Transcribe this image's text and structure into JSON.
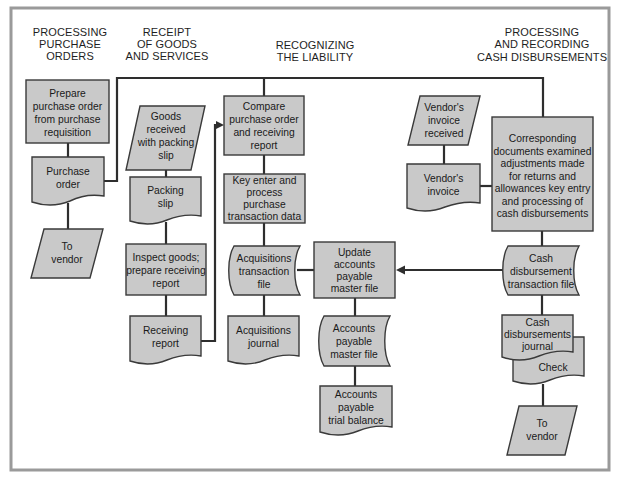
{
  "diagram": {
    "type": "flowchart",
    "colors": {
      "shape_fill": "#c9c9c9",
      "shape_stroke": "#3a3a3a",
      "connector": "#2e2e2e",
      "frame": "#9a9a9a",
      "background": "#ffffff"
    },
    "columns": [
      {
        "id": "col1",
        "lines": [
          "PROCESSING",
          "PURCHASE",
          "ORDERS"
        ]
      },
      {
        "id": "col2",
        "lines": [
          "RECEIPT",
          "OF GOODS",
          "AND SERVICES"
        ]
      },
      {
        "id": "col3",
        "lines": [
          "RECOGNIZING",
          "THE LIABILITY"
        ]
      },
      {
        "id": "col4",
        "lines": [
          "PROCESSING",
          "AND RECORDING",
          "CASH DISBURSEMENTS"
        ]
      }
    ],
    "nodes": [
      {
        "id": "prepare_po",
        "shape": "process",
        "lines": [
          "Prepare",
          "purchase order",
          "from purchase",
          "requisition"
        ]
      },
      {
        "id": "purchase_order",
        "shape": "document",
        "lines": [
          "Purchase",
          "order"
        ]
      },
      {
        "id": "to_vendor_1",
        "shape": "io",
        "lines": [
          "To",
          "vendor"
        ]
      },
      {
        "id": "goods_received",
        "shape": "io",
        "lines": [
          "Goods",
          "received",
          "with packing",
          "slip"
        ]
      },
      {
        "id": "packing_slip",
        "shape": "document",
        "lines": [
          "Packing",
          "slip"
        ]
      },
      {
        "id": "inspect_goods",
        "shape": "process",
        "lines": [
          "Inspect goods;",
          "prepare receiving",
          "report"
        ]
      },
      {
        "id": "receiving_report",
        "shape": "document",
        "lines": [
          "Receiving",
          "report"
        ]
      },
      {
        "id": "compare",
        "shape": "process",
        "lines": [
          "Compare",
          "purchase order",
          "and receiving",
          "report"
        ]
      },
      {
        "id": "key_enter",
        "shape": "process",
        "lines": [
          "Key enter and",
          "process",
          "purchase",
          "transaction data"
        ]
      },
      {
        "id": "acq_trans_file",
        "shape": "storage",
        "lines": [
          "Acquisitions",
          "transaction",
          "file"
        ]
      },
      {
        "id": "acq_journal",
        "shape": "document",
        "lines": [
          "Acquisitions",
          "journal"
        ]
      },
      {
        "id": "update_ap",
        "shape": "process",
        "lines": [
          "Update",
          "accounts",
          "payable",
          "master file"
        ]
      },
      {
        "id": "ap_master_file",
        "shape": "storage",
        "lines": [
          "Accounts",
          "payable",
          "master file"
        ]
      },
      {
        "id": "ap_trial_balance",
        "shape": "document",
        "lines": [
          "Accounts",
          "payable",
          "trial balance"
        ]
      },
      {
        "id": "vendor_invoice_received",
        "shape": "io",
        "lines": [
          "Vendor's",
          "invoice",
          "received"
        ]
      },
      {
        "id": "vendor_invoice",
        "shape": "document",
        "lines": [
          "Vendor's",
          "invoice"
        ]
      },
      {
        "id": "corresponding_docs",
        "shape": "process",
        "lines": [
          "Corresponding",
          "documents examined",
          "adjustments made",
          "for returns and",
          "allowances key entry",
          "and processing of",
          "cash disbursements"
        ]
      },
      {
        "id": "cash_disb_trans_file",
        "shape": "storage",
        "lines": [
          "Cash",
          "disbursement",
          "transaction file"
        ]
      },
      {
        "id": "check",
        "shape": "document",
        "lines": [
          "Check"
        ]
      },
      {
        "id": "cash_disb_journal",
        "shape": "document",
        "lines": [
          "Cash",
          "disbursements",
          "journal"
        ]
      },
      {
        "id": "to_vendor_2",
        "shape": "io",
        "lines": [
          "To",
          "vendor"
        ]
      }
    ],
    "edges": [
      {
        "from": "prepare_po",
        "to": "purchase_order"
      },
      {
        "from": "purchase_order",
        "to": "to_vendor_1"
      },
      {
        "from": "purchase_order",
        "to": "compare"
      },
      {
        "from": "compare",
        "to": "corresponding_docs"
      },
      {
        "from": "goods_received",
        "to": "packing_slip"
      },
      {
        "from": "packing_slip",
        "to": "inspect_goods"
      },
      {
        "from": "inspect_goods",
        "to": "receiving_report"
      },
      {
        "from": "receiving_report",
        "to": "compare",
        "arrow": true
      },
      {
        "from": "compare",
        "to": "key_enter"
      },
      {
        "from": "key_enter",
        "to": "acq_trans_file"
      },
      {
        "from": "acq_trans_file",
        "to": "acq_journal"
      },
      {
        "from": "acq_trans_file",
        "to": "update_ap"
      },
      {
        "from": "cash_disb_trans_file",
        "to": "update_ap",
        "arrow": true
      },
      {
        "from": "update_ap",
        "to": "ap_master_file"
      },
      {
        "from": "ap_master_file",
        "to": "ap_trial_balance"
      },
      {
        "from": "vendor_invoice_received",
        "to": "vendor_invoice"
      },
      {
        "from": "vendor_invoice",
        "to": "corresponding_docs"
      },
      {
        "from": "corresponding_docs",
        "to": "cash_disb_trans_file"
      },
      {
        "from": "cash_disb_trans_file",
        "to": "cash_disb_journal"
      },
      {
        "from": "check",
        "to": "to_vendor_2"
      }
    ]
  }
}
